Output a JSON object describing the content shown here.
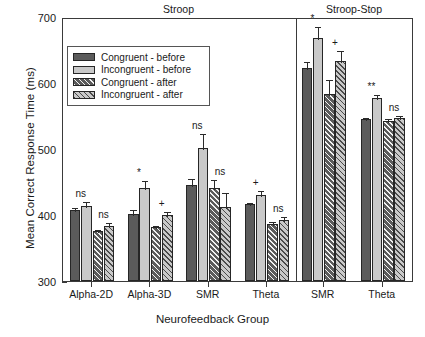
{
  "chart_data": {
    "type": "bar",
    "title": "",
    "xlabel": "Neurofeedback Group",
    "ylabel": "Mean Correct Response Time (ms)",
    "ylim": [
      300,
      700
    ],
    "yticks": [
      300,
      400,
      500,
      600,
      700
    ],
    "grid": false,
    "legend_position": "upper left",
    "panels": [
      {
        "name": "Stroop",
        "groups": [
          "Alpha-2D",
          "Alpha-3D",
          "SMR",
          "Theta"
        ]
      },
      {
        "name": "Stroop-Stop",
        "groups": [
          "SMR",
          "Theta"
        ]
      }
    ],
    "categories": [
      "Alpha-2D",
      "Alpha-3D",
      "SMR",
      "Theta",
      "SMR",
      "Theta"
    ],
    "series": [
      {
        "name": "Congruent - before",
        "values": [
          407,
          402,
          445,
          416,
          623,
          546
        ],
        "errors": [
          6,
          8,
          13,
          5,
          12,
          4
        ]
      },
      {
        "name": "Incongruent - before",
        "values": [
          414,
          441,
          501,
          431,
          668,
          578
        ],
        "errors": [
          8,
          13,
          25,
          9,
          20,
          7
        ]
      },
      {
        "name": "Congruent - after",
        "values": [
          376,
          382,
          441,
          386,
          583,
          543
        ],
        "errors": [
          5,
          5,
          15,
          6,
          24,
          5
        ]
      },
      {
        "name": "Incongruent - after",
        "values": [
          384,
          400,
          412,
          393,
          634,
          547
        ],
        "errors": [
          7,
          7,
          25,
          7,
          17,
          6
        ]
      }
    ],
    "annotations": [
      {
        "category_index": 0,
        "pair": "before",
        "label": "ns"
      },
      {
        "category_index": 0,
        "pair": "after",
        "label": "ns"
      },
      {
        "category_index": 1,
        "pair": "before",
        "label": "*"
      },
      {
        "category_index": 1,
        "pair": "after",
        "label": "+"
      },
      {
        "category_index": 2,
        "pair": "before",
        "label": "ns"
      },
      {
        "category_index": 2,
        "pair": "after",
        "label": "ns"
      },
      {
        "category_index": 3,
        "pair": "before",
        "label": "+"
      },
      {
        "category_index": 3,
        "pair": "after",
        "label": "ns"
      },
      {
        "category_index": 4,
        "pair": "before",
        "label": "*"
      },
      {
        "category_index": 4,
        "pair": "after",
        "label": "+"
      },
      {
        "category_index": 5,
        "pair": "before",
        "label": "**"
      },
      {
        "category_index": 5,
        "pair": "after",
        "label": "ns"
      }
    ],
    "colors": {
      "congruent_before": "#5b5b5b",
      "incongruent_before": "#c9c9c9",
      "congruent_after": "#5b5b5b",
      "incongruent_after": "#c9c9c9",
      "axis": "#3a3a3a",
      "background": "#ffffff"
    }
  },
  "legend": {
    "items": [
      {
        "label": "Congruent - before",
        "style": "fill-dark"
      },
      {
        "label": "Incongruent - before",
        "style": "fill-light"
      },
      {
        "label": "Congruent - after",
        "style": "hatch-dark"
      },
      {
        "label": "Incongruent - after",
        "style": "hatch-light"
      }
    ]
  }
}
